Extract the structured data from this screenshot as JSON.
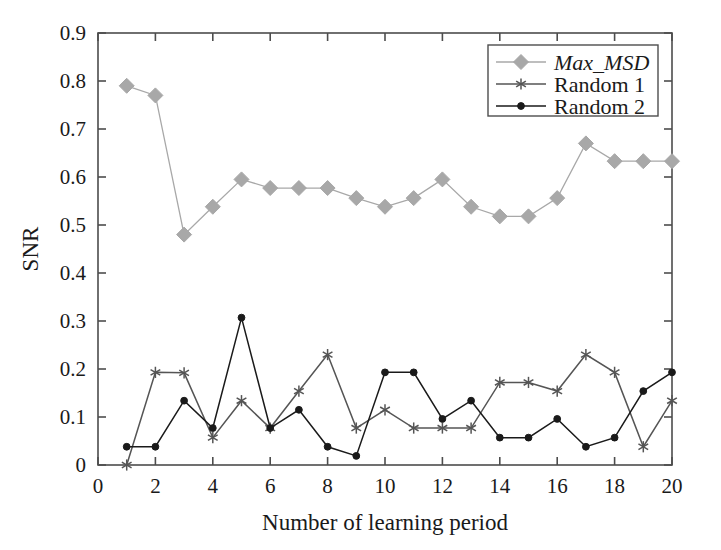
{
  "chart_data": {
    "type": "line",
    "title": "",
    "xlabel": "Number of learning period",
    "ylabel": "SNR",
    "xlim": [
      0,
      20
    ],
    "ylim": [
      0,
      0.9
    ],
    "xticks": [
      0,
      2,
      4,
      6,
      8,
      10,
      12,
      14,
      16,
      18,
      20
    ],
    "xtick_labels": [
      "0",
      "2",
      "4",
      "6",
      "8",
      "10",
      "12",
      "14",
      "16",
      "18",
      "20"
    ],
    "yticks": [
      0,
      0.1,
      0.2,
      0.3,
      0.4,
      0.5,
      0.6,
      0.7,
      0.8,
      0.9
    ],
    "ytick_labels": [
      "0",
      "0.1",
      "0.2",
      "0.3",
      "0.4",
      "0.5",
      "0.6",
      "0.7",
      "0.8",
      "0.9"
    ],
    "grid": false,
    "legend_position": "top-right",
    "x": [
      1,
      2,
      3,
      4,
      5,
      6,
      7,
      8,
      9,
      10,
      11,
      12,
      13,
      14,
      15,
      16,
      17,
      18,
      19,
      20
    ],
    "series": [
      {
        "name": "Max_MSD",
        "italic": true,
        "color": "#a8a8a8",
        "marker": "diamond",
        "values": [
          0.79,
          0.77,
          0.48,
          0.538,
          0.595,
          0.577,
          0.577,
          0.577,
          0.556,
          0.538,
          0.556,
          0.595,
          0.538,
          0.518,
          0.518,
          0.556,
          0.67,
          0.633,
          0.633,
          0.633
        ]
      },
      {
        "name": "Random 1",
        "italic": false,
        "color": "#555555",
        "marker": "star",
        "values": [
          0.0,
          0.193,
          0.192,
          0.057,
          0.134,
          0.077,
          0.154,
          0.23,
          0.077,
          0.115,
          0.077,
          0.077,
          0.077,
          0.172,
          0.172,
          0.154,
          0.23,
          0.193,
          0.038,
          0.134
        ]
      },
      {
        "name": "Random 2",
        "italic": false,
        "color": "#1a1a1a",
        "marker": "circle",
        "values": [
          0.038,
          0.038,
          0.134,
          0.077,
          0.307,
          0.077,
          0.115,
          0.038,
          0.019,
          0.193,
          0.193,
          0.096,
          0.134,
          0.057,
          0.057,
          0.096,
          0.038,
          0.057,
          0.154,
          0.193
        ]
      }
    ]
  }
}
